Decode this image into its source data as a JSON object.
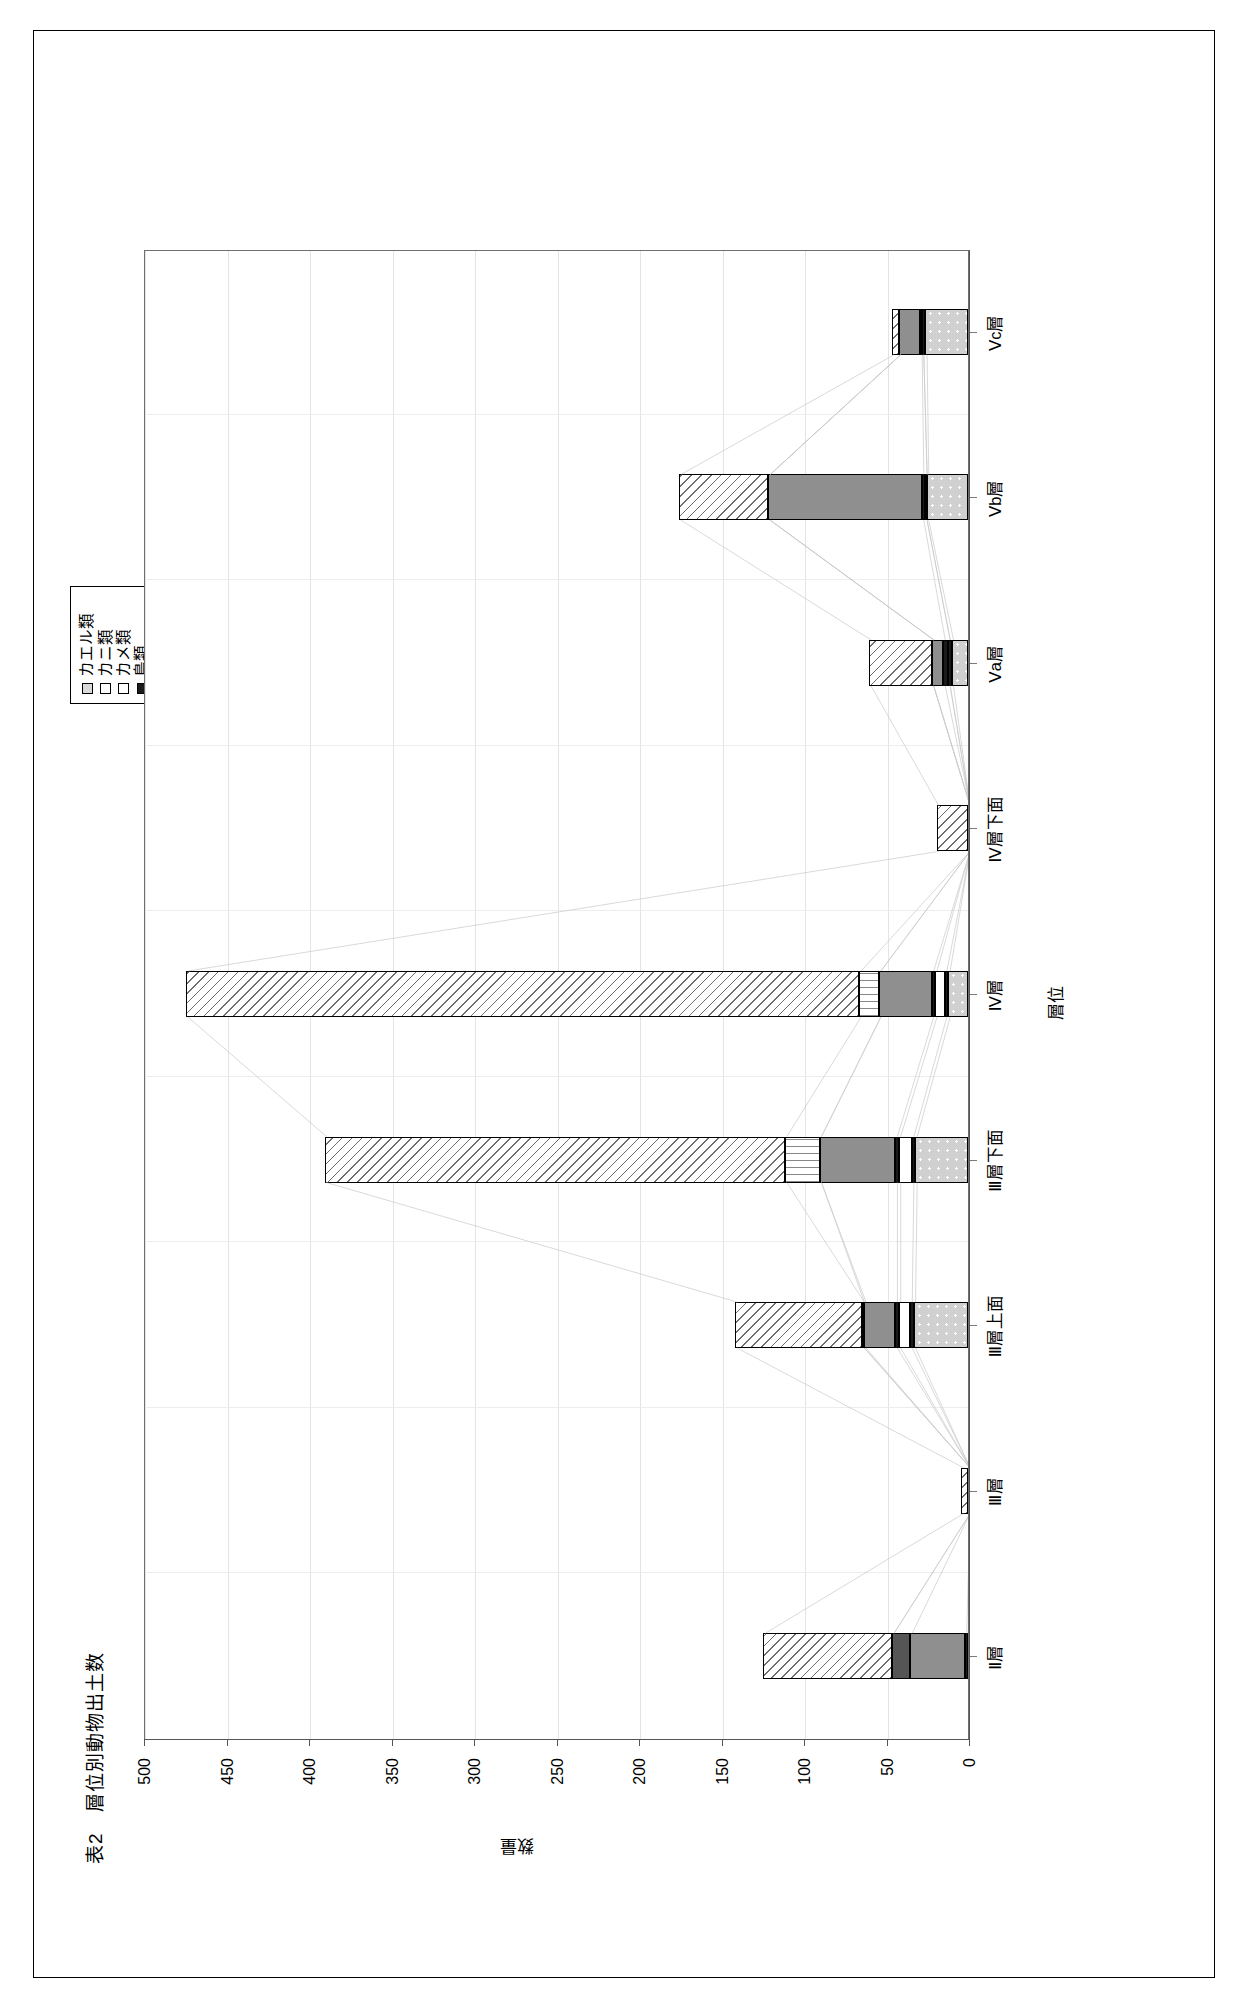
{
  "figure": {
    "title": "表2　層位別動物出土数"
  },
  "legend": {
    "items": [
      {
        "label": "カエル類",
        "pattern": "p-lightgray",
        "color": "#d9d9d9"
      },
      {
        "label": "カニ類",
        "pattern": "p-empty",
        "color": "#ffffff"
      },
      {
        "label": "カメ類",
        "pattern": "p-empty",
        "color": "#ffffff"
      },
      {
        "label": "鳥類",
        "pattern": "p-black",
        "color": "#1a1a1a"
      },
      {
        "label": "イノシシ他",
        "pattern": "p-gray",
        "color": "#8c8c8c"
      },
      {
        "label": "海棲哺乳類",
        "pattern": "p-darkgray",
        "color": "#555555"
      },
      {
        "label": "その他",
        "pattern": "p-empty",
        "color": "#ffffff"
      },
      {
        "label": "魚類",
        "pattern": "p-empty",
        "color": "#ffffff"
      }
    ]
  },
  "chart_data": {
    "type": "bar",
    "stacked": true,
    "orientation": "vertical",
    "title": "表2　層位別動物出土数",
    "xlabel": "層位",
    "ylabel": "数量",
    "ylim": [
      0,
      500
    ],
    "yticks": [
      0,
      50,
      100,
      150,
      200,
      250,
      300,
      350,
      400,
      450,
      500
    ],
    "ytick_labels": [
      "0",
      "50",
      "100",
      "150",
      "200",
      "250",
      "300",
      "350",
      "400",
      "450",
      "500"
    ],
    "grid": true,
    "legend_position": "top-right",
    "categories": [
      "Ⅱ層",
      "Ⅲ層",
      "Ⅲ層上面",
      "Ⅲ層下面",
      "Ⅳ層",
      "Ⅳ層下面",
      "Ⅴa層",
      "Ⅴb層",
      "Ⅴc層"
    ],
    "series": [
      {
        "name": "カエル類",
        "pattern": "p-dots",
        "values": [
          0,
          0,
          33,
          32,
          12,
          0,
          10,
          25,
          26
        ]
      },
      {
        "name": "カニ類",
        "pattern": "p-black",
        "values": [
          0,
          0,
          2,
          2,
          2,
          0,
          2,
          1,
          2
        ]
      },
      {
        "name": "カメ類",
        "pattern": "p-empty",
        "values": [
          0,
          0,
          7,
          8,
          6,
          0,
          0,
          0,
          0
        ]
      },
      {
        "name": "鳥類",
        "pattern": "p-black",
        "values": [
          2,
          0,
          2,
          2,
          2,
          0,
          3,
          2,
          1
        ]
      },
      {
        "name": "イノシシ他",
        "pattern": "p-solidgray",
        "values": [
          33,
          0,
          19,
          46,
          32,
          0,
          7,
          93,
          13
        ]
      },
      {
        "name": "海棲哺乳類",
        "pattern": "p-darkgray",
        "values": [
          11,
          0,
          1,
          0,
          0,
          0,
          0,
          0,
          0
        ]
      },
      {
        "name": "その他",
        "pattern": "p-wave",
        "values": [
          0,
          0,
          0,
          21,
          12,
          0,
          0,
          0,
          0
        ]
      },
      {
        "name": "魚類",
        "pattern": "p-diag",
        "values": [
          78,
          4,
          77,
          279,
          408,
          19,
          38,
          54,
          4
        ]
      }
    ],
    "totals": [
      124,
      4,
      141,
      390,
      474,
      19,
      60,
      175,
      46
    ]
  }
}
